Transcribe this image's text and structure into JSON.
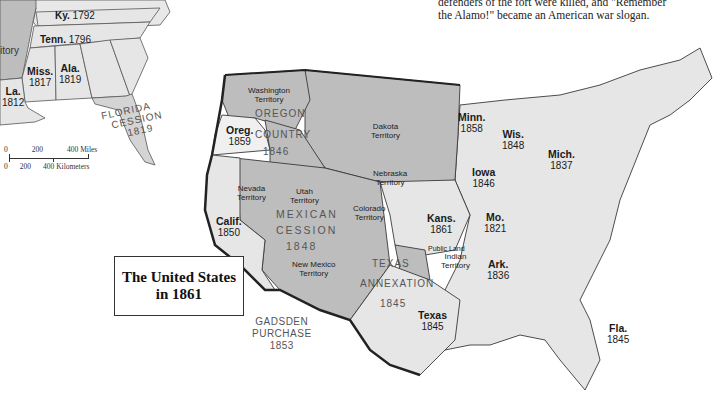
{
  "caption": {
    "line1": "defenders of the fort were killed, and \"Remember",
    "line2": "the Alamo!\" became an American war slogan."
  },
  "title_box": {
    "line1": "The United States",
    "line2": "in 1861"
  },
  "scale_bar": {
    "miles": [
      "0",
      "200",
      "400 Miles"
    ],
    "kilometers": [
      "0",
      "200",
      "400 Kilometers"
    ]
  },
  "inset_states": [
    {
      "name": "Ky.",
      "year": "1792"
    },
    {
      "name": "Tenn.",
      "year": "1796"
    },
    {
      "name": "Miss.",
      "year": "1817"
    },
    {
      "name": "Ala.",
      "year": "1819"
    },
    {
      "name": "La.",
      "year": "1812"
    },
    {
      "name": "",
      "year": "",
      "partial_label": "itory"
    }
  ],
  "inset_regions": {
    "florida_cession": [
      "FLORIDA",
      "CESSION",
      "1819"
    ]
  },
  "states": [
    {
      "name": "Oreg.",
      "year": "1859"
    },
    {
      "name": "Calif.",
      "year": "1850"
    },
    {
      "name": "Minn.",
      "year": "1858"
    },
    {
      "name": "Wis.",
      "year": "1848"
    },
    {
      "name": "Mich.",
      "year": "1837"
    },
    {
      "name": "Iowa",
      "year": "1846"
    },
    {
      "name": "Kans.",
      "year": "1861"
    },
    {
      "name": "Mo.",
      "year": "1821"
    },
    {
      "name": "Ark.",
      "year": "1836"
    },
    {
      "name": "Texas",
      "year": "1845"
    },
    {
      "name": "Fla.",
      "year": "1845"
    }
  ],
  "territories": [
    {
      "line1": "Washington",
      "line2": "Territory"
    },
    {
      "line1": "Dakota",
      "line2": "Territory"
    },
    {
      "line1": "Nebraska",
      "line2": "Territory"
    },
    {
      "line1": "Nevada",
      "line2": "Territory"
    },
    {
      "line1": "Utah",
      "line2": "Territory"
    },
    {
      "line1": "Colorado",
      "line2": "Territory"
    },
    {
      "line1": "New Mexico",
      "line2": "Territory"
    },
    {
      "line1": "Indian",
      "line2": "Territory"
    },
    {
      "line1": "Public Land",
      "line2": ""
    }
  ],
  "regions": {
    "oregon_country": [
      "OREGON",
      "COUNTRY",
      "1846"
    ],
    "mexican_cession": [
      "MEXICAN",
      "CESSION",
      "1848"
    ],
    "texas_annexation": [
      "TEXAS",
      "ANNEXATION",
      "1845"
    ],
    "gadsden_purchase": [
      "GADSDEN",
      "PURCHASE",
      "1853"
    ]
  },
  "colors": {
    "state_fill": "#e6e6e6",
    "territory_fill": "#bdbdbd",
    "oregon_state_fill": "#f0f0f0",
    "border": "#3a3a3a",
    "background": "#ffffff"
  }
}
